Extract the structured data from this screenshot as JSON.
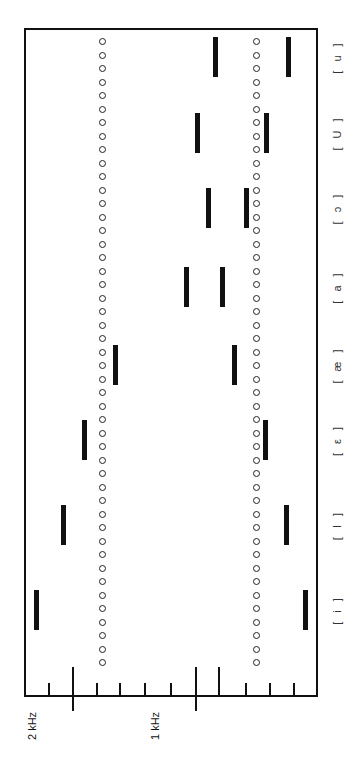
{
  "chart_data": {
    "type": "bar",
    "title": "",
    "orientation": "rotated 90° counterclockwise (frequency axis along bottom edge, increasing leftward)",
    "xlabel": "",
    "ylabel": "Frequency",
    "frequency_axis": {
      "tick_labels": [
        "2 kHz",
        "1 kHz"
      ],
      "major_ticks_hz": [
        2000,
        1000
      ],
      "minor_tick_step_hz": 200,
      "range_hz": [
        0,
        2400
      ]
    },
    "categories": [
      "[i]",
      "[I]",
      "[ε]",
      "[æ]",
      "[a]",
      "[ɔ]",
      "[U]",
      "[u]"
    ],
    "series": [
      {
        "name": "F1",
        "values": [
          100,
          260,
          430,
          680,
          780,
          580,
          420,
          240
        ]
      },
      {
        "name": "F2",
        "values": [
          2290,
          2070,
          1900,
          1650,
          1070,
          890,
          980,
          830
        ]
      }
    ],
    "reference_lines": [
      {
        "name": "dotted line upper",
        "style": "circles",
        "value_hz": 1750
      },
      {
        "name": "dotted line lower",
        "style": "circles",
        "value_hz": 500
      }
    ],
    "grid": false,
    "legend": null
  },
  "axis": {
    "label_2khz": "2 kHz",
    "label_1khz": "1 kHz"
  },
  "vowels": [
    {
      "label": "[ i ]",
      "y": 610
    },
    {
      "label": "[ I ]",
      "y": 525
    },
    {
      "label": "[ ε ]",
      "y": 440
    },
    {
      "label": "[ æ ]",
      "y": 365
    },
    {
      "label": "[ a ]",
      "y": 287
    },
    {
      "label": "[ ɔ ]",
      "y": 208
    },
    {
      "label": "[ U ]",
      "y": 133
    },
    {
      "label": "[ u ]",
      "y": 57
    }
  ]
}
